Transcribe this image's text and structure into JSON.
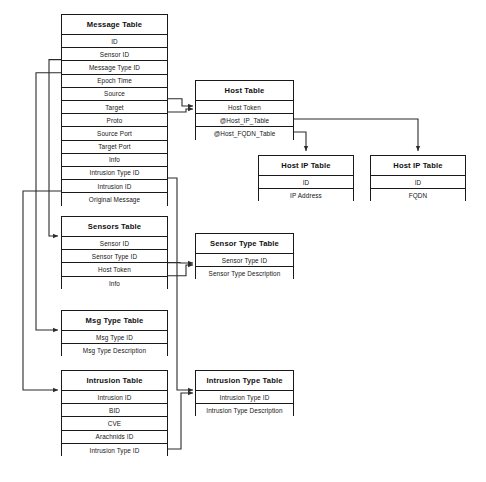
{
  "diagram": {
    "caption": "",
    "line_color": "#2b2b2b",
    "border_color": "#1a1a1a",
    "background": "#ffffff",
    "tables": [
      {
        "id": "message-table",
        "name": "Message Table",
        "x": 61,
        "y": 14,
        "w": 107,
        "title_h": 20,
        "row_h": 13.2,
        "fields": [
          "ID",
          "Sensor ID",
          "Message Type ID",
          "Epoch Time",
          "Source",
          "Target",
          "Proto",
          "Source Port",
          "Target Port",
          "Info",
          "Intrusion Type ID",
          "Intrusion ID",
          "Original Message"
        ]
      },
      {
        "id": "host-table",
        "name": "Host Table",
        "x": 195,
        "y": 80,
        "w": 99,
        "title_h": 20,
        "row_h": 13.2,
        "fields": [
          "Host Token",
          "@Host_IP_Table",
          "@Host_FQDN_Table"
        ]
      },
      {
        "id": "host-ip-table",
        "name": "Host IP Table",
        "x": 258,
        "y": 155,
        "w": 96,
        "title_h": 20,
        "row_h": 13.2,
        "fields": [
          "ID",
          "IP Address"
        ]
      },
      {
        "id": "host-fqdn-table",
        "name": "Host IP Table",
        "x": 370,
        "y": 155,
        "w": 96,
        "title_h": 20,
        "row_h": 13.2,
        "fields": [
          "ID",
          "FQDN"
        ]
      },
      {
        "id": "sensors-table",
        "name": "Sensors Table",
        "x": 61,
        "y": 216,
        "w": 107,
        "title_h": 20,
        "row_h": 13.2,
        "fields": [
          "Sensor ID",
          "Sensor Type ID",
          "Host Token",
          "Info"
        ]
      },
      {
        "id": "sensor-type-table",
        "name": "Sensor Type Table",
        "x": 195,
        "y": 233,
        "w": 99,
        "title_h": 20,
        "row_h": 13.2,
        "fields": [
          "Sensor Type ID",
          "Sensor Type Description"
        ]
      },
      {
        "id": "msg-type-table",
        "name": "Msg Type Table",
        "x": 61,
        "y": 310,
        "w": 107,
        "title_h": 20,
        "row_h": 13.2,
        "fields": [
          "Msg Type ID",
          "Msg Type Description"
        ]
      },
      {
        "id": "intrusion-table",
        "name": "Intrusion Table",
        "x": 61,
        "y": 370,
        "w": 107,
        "title_h": 20,
        "row_h": 13.2,
        "fields": [
          "Intrusion ID",
          "BID",
          "CVE",
          "Arachnids ID",
          "Intrusion Type ID"
        ]
      },
      {
        "id": "intrusion-type-table",
        "name": "Intrusion Type Table",
        "x": 195,
        "y": 370,
        "w": 99,
        "title_h": 20,
        "row_h": 13.2,
        "fields": [
          "Intrusion Type ID",
          "Intrusion Type Description"
        ]
      }
    ],
    "relationships": [
      {
        "id": "rel-source-host",
        "from_table": "Message Table",
        "from_field": "Source",
        "to_table": "Host Table",
        "to_field": "Host Token"
      },
      {
        "id": "rel-target-host",
        "from_table": "Message Table",
        "from_field": "Target",
        "to_table": "Host Table",
        "to_field": "Host Token"
      },
      {
        "id": "rel-sensorid-sensors",
        "from_table": "Message Table",
        "from_field": "Sensor ID",
        "to_table": "Sensors Table",
        "to_field": "Sensor ID"
      },
      {
        "id": "rel-msgtype-msgtypetable",
        "from_table": "Message Table",
        "from_field": "Message Type ID",
        "to_table": "Msg Type Table",
        "to_field": "Msg Type ID"
      },
      {
        "id": "rel-intrusionid-intrusion",
        "from_table": "Message Table",
        "from_field": "Intrusion ID",
        "to_table": "Intrusion Table",
        "to_field": "Intrusion ID"
      },
      {
        "id": "rel-msgintrtype-intrtype",
        "from_table": "Message Table",
        "from_field": "Intrusion Type ID",
        "to_table": "Intrusion Type Table",
        "to_field": "Intrusion Type ID"
      },
      {
        "id": "rel-hostip-hostiptable",
        "from_table": "Host Table",
        "from_field": "@Host_IP_Table",
        "to_table": "Host IP Table",
        "to_field": "ID"
      },
      {
        "id": "rel-hostfqdn-hostfqdntable",
        "from_table": "Host Table",
        "from_field": "@Host_FQDN_Table",
        "to_table": "Host IP Table",
        "to_field": "ID"
      },
      {
        "id": "rel-sensortype-sensortype",
        "from_table": "Sensors Table",
        "from_field": "Sensor Type ID",
        "to_table": "Sensor Type Table",
        "to_field": "Sensor Type ID"
      },
      {
        "id": "rel-hosttoken-sensortype",
        "from_table": "Sensors Table",
        "from_field": "Host Token",
        "to_table": "Sensor Type Table",
        "to_field": "Sensor Type ID"
      },
      {
        "id": "rel-intrtype-intrtypetable",
        "from_table": "Intrusion Table",
        "from_field": "Intrusion Type ID",
        "to_table": "Intrusion Type Table",
        "to_field": "Intrusion Type ID"
      }
    ]
  }
}
